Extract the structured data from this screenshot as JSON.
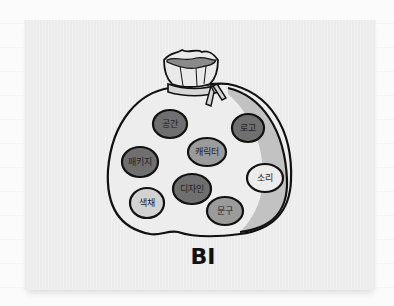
{
  "illustration": {
    "title": "BI",
    "keywords": [
      {
        "label": "공간",
        "cx": 170,
        "cy": 124,
        "rx": 17,
        "ry": 14,
        "fill": "#6f6f6f"
      },
      {
        "label": "로고",
        "cx": 248,
        "cy": 128,
        "rx": 16,
        "ry": 14,
        "fill": "#6f6f6f"
      },
      {
        "label": "캐릭터",
        "cx": 207,
        "cy": 152,
        "rx": 19,
        "ry": 14,
        "fill": "#9b9b9b"
      },
      {
        "label": "패키지",
        "cx": 140,
        "cy": 162,
        "rx": 18,
        "ry": 15,
        "fill": "#6f6f6f"
      },
      {
        "label": "소리",
        "cx": 265,
        "cy": 178,
        "rx": 18,
        "ry": 14,
        "fill": "#ececec"
      },
      {
        "label": "디자인",
        "cx": 192,
        "cy": 189,
        "rx": 19,
        "ry": 15,
        "fill": "#6f6f6f"
      },
      {
        "label": "색채",
        "cx": 147,
        "cy": 203,
        "rx": 17,
        "ry": 15,
        "fill": "#d2d2d2"
      },
      {
        "label": "문구",
        "cx": 225,
        "cy": 211,
        "rx": 18,
        "ry": 14,
        "fill": "#9b9b9b"
      }
    ],
    "colors": {
      "card_bg": "#ececec",
      "bag_fill": "#ededed",
      "bag_shade": "#bdbdbd",
      "outline": "#111111"
    }
  }
}
